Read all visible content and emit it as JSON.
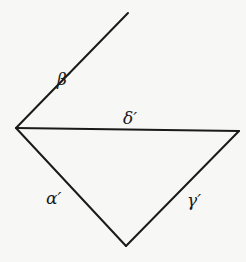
{
  "diagram": {
    "background": "#f7f7f5",
    "stroke_color": "#1a1a1a",
    "vertices": {
      "top": [
        128,
        13
      ],
      "left": [
        16,
        128
      ],
      "right": [
        239,
        131
      ],
      "bottom": [
        126,
        246
      ]
    },
    "edges": [
      {
        "id": "beta",
        "label": "β′",
        "from": "left",
        "to": "top",
        "label_pos": [
          58,
          85
        ]
      },
      {
        "id": "delta",
        "label": "δ′",
        "from": "left",
        "to": "right",
        "label_pos": [
          123,
          124
        ]
      },
      {
        "id": "alpha",
        "label": "α′",
        "from": "left",
        "to": "bottom",
        "label_pos": [
          46,
          204
        ]
      },
      {
        "id": "gamma",
        "label": "γ′",
        "from": "right",
        "to": "bottom",
        "label_pos": [
          187,
          205
        ]
      }
    ]
  },
  "labels": {
    "beta": "β′",
    "delta": "δ′",
    "alpha": "α′",
    "gamma": "γ′"
  }
}
